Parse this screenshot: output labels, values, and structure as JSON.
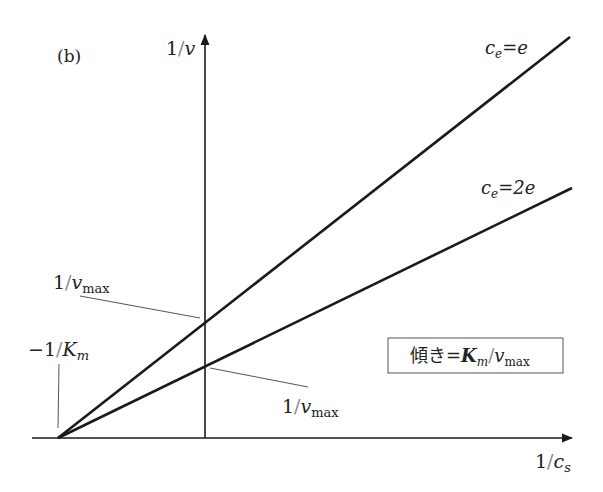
{
  "panel_label": "(b)",
  "axes": {
    "y_label": {
      "num": "1",
      "slash": "/",
      "var": "v"
    },
    "x_label": {
      "num": "1",
      "slash": "/",
      "var": "c",
      "sub": "s"
    }
  },
  "lines": [
    {
      "label_var": "c",
      "label_sub": "e",
      "label_eq": "=",
      "label_val": "e",
      "name": "c_e = e"
    },
    {
      "label_var": "c",
      "label_sub": "e",
      "label_eq": "=",
      "label_val": "2e",
      "name": "c_e = 2e"
    }
  ],
  "annotations": {
    "intercept_upper": {
      "num": "1",
      "slash": "/",
      "var": "v",
      "sub": "max"
    },
    "intercept_lower": {
      "num": "1",
      "slash": "/",
      "var": "v",
      "sub": "max"
    },
    "x_intercept": {
      "prefix": "−1",
      "slash": "/",
      "var": "K",
      "sub": "m"
    }
  },
  "slope_box": {
    "prefix": "傾き",
    "eq": "=",
    "var1": "K",
    "sub1": "m",
    "slash": "/",
    "var2": "v",
    "sub2": "max"
  },
  "colors": {
    "line": "#1a1a1a",
    "leader": "#555555",
    "text": "#222222"
  }
}
